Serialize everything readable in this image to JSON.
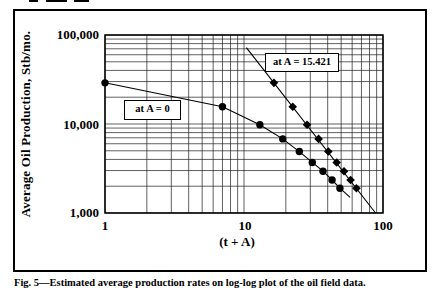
{
  "figure": {
    "caption": "Fig. 5—Estimated average production rates on log-log plot of the oil field data."
  },
  "chart_data": {
    "type": "line",
    "x_scale": "log",
    "y_scale": "log",
    "title": "",
    "xlabel": "(t + A)",
    "ylabel": "Average Oil Production, Stb/mo.",
    "xlim": [
      1,
      100
    ],
    "ylim": [
      1000,
      100000
    ],
    "grid": "log major and minor gridlines on both axes",
    "legend_position": "none",
    "x_ticks": [
      {
        "value": 1,
        "label": "1"
      },
      {
        "value": 10,
        "label": "10"
      },
      {
        "value": 100,
        "label": "100"
      }
    ],
    "y_ticks": [
      {
        "value": 100000,
        "label": "100,000"
      },
      {
        "value": 10000,
        "label": "10,000"
      },
      {
        "value": 1000,
        "label": "1,000"
      }
    ],
    "annotations": [
      {
        "text": "at A = 0"
      },
      {
        "text": "at A = 15.421"
      }
    ],
    "A_shift": 15.421,
    "series": [
      {
        "name": "at A = 0",
        "marker": "circle",
        "points": [
          [
            1,
            29000
          ],
          [
            7,
            15600
          ],
          [
            13,
            9800
          ],
          [
            19,
            6800
          ],
          [
            25,
            4900
          ],
          [
            31,
            3700
          ],
          [
            37,
            2950
          ],
          [
            43,
            2350
          ],
          [
            49,
            1900
          ]
        ],
        "line_extension": [
          [
            58,
            1500
          ]
        ]
      },
      {
        "name": "at A = 15.421",
        "marker": "diamond",
        "points": [
          [
            16.421,
            29000
          ],
          [
            22.421,
            15600
          ],
          [
            28.421,
            9800
          ],
          [
            34.421,
            6800
          ],
          [
            40.421,
            4900
          ],
          [
            46.421,
            3700
          ],
          [
            52.421,
            2950
          ],
          [
            58.421,
            2350
          ],
          [
            64.421,
            1900
          ]
        ],
        "trend_line": [
          [
            10.4,
            72000
          ],
          [
            88.4,
            1000
          ]
        ]
      }
    ]
  }
}
